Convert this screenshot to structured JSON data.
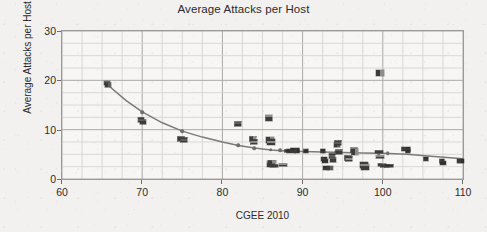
{
  "chart_data": {
    "type": "scatter",
    "title": "Average Attacks per Host",
    "xlabel": "CGEE 2010",
    "ylabel": "Average Attacks per Host",
    "xlim": [
      60,
      110
    ],
    "ylim": [
      0,
      30
    ],
    "xticks": [
      60,
      70,
      80,
      90,
      100,
      110
    ],
    "yticks": [
      0,
      10,
      20,
      30
    ],
    "x_minor_step": 2.5,
    "y_minor_step": 2.5,
    "grid": true,
    "legend": "none",
    "marker_style": "country-flag-icons",
    "points": [
      {
        "x": 65.6,
        "y": 19.5
      },
      {
        "x": 65.7,
        "y": 19.0
      },
      {
        "x": 69.9,
        "y": 12.0
      },
      {
        "x": 70.1,
        "y": 11.6
      },
      {
        "x": 74.9,
        "y": 8.2
      },
      {
        "x": 75.2,
        "y": 8.0
      },
      {
        "x": 81.9,
        "y": 11.1
      },
      {
        "x": 83.8,
        "y": 8.1
      },
      {
        "x": 84.0,
        "y": 7.6
      },
      {
        "x": 85.8,
        "y": 12.3
      },
      {
        "x": 85.9,
        "y": 7.9
      },
      {
        "x": 86.0,
        "y": 7.6
      },
      {
        "x": 86.0,
        "y": 3.0
      },
      {
        "x": 86.2,
        "y": 3.4
      },
      {
        "x": 86.4,
        "y": 2.7
      },
      {
        "x": 87.6,
        "y": 2.8
      },
      {
        "x": 88.3,
        "y": 5.6
      },
      {
        "x": 88.6,
        "y": 5.7
      },
      {
        "x": 89.0,
        "y": 5.9
      },
      {
        "x": 89.3,
        "y": 5.6
      },
      {
        "x": 90.4,
        "y": 5.6
      },
      {
        "x": 92.6,
        "y": 5.7
      },
      {
        "x": 92.7,
        "y": 4.1
      },
      {
        "x": 92.8,
        "y": 3.7
      },
      {
        "x": 92.9,
        "y": 2.3
      },
      {
        "x": 93.4,
        "y": 2.3
      },
      {
        "x": 93.7,
        "y": 4.6
      },
      {
        "x": 93.8,
        "y": 3.9
      },
      {
        "x": 94.3,
        "y": 6.8
      },
      {
        "x": 94.4,
        "y": 7.2
      },
      {
        "x": 94.6,
        "y": 5.5
      },
      {
        "x": 95.6,
        "y": 4.3
      },
      {
        "x": 95.8,
        "y": 4.0
      },
      {
        "x": 96.4,
        "y": 5.8
      },
      {
        "x": 96.5,
        "y": 5.4
      },
      {
        "x": 97.6,
        "y": 2.9
      },
      {
        "x": 97.8,
        "y": 2.4
      },
      {
        "x": 99.6,
        "y": 21.5
      },
      {
        "x": 99.5,
        "y": 5.4
      },
      {
        "x": 99.6,
        "y": 4.5
      },
      {
        "x": 99.9,
        "y": 2.8
      },
      {
        "x": 100.3,
        "y": 2.6
      },
      {
        "x": 100.8,
        "y": 2.7
      },
      {
        "x": 102.9,
        "y": 6.1
      },
      {
        "x": 103.1,
        "y": 5.6
      },
      {
        "x": 105.4,
        "y": 4.0
      },
      {
        "x": 107.4,
        "y": 3.6
      },
      {
        "x": 107.5,
        "y": 3.3
      },
      {
        "x": 109.6,
        "y": 3.7
      },
      {
        "x": 109.8,
        "y": 3.6
      }
    ],
    "trend_line": {
      "name": "fitted power-law trend",
      "color": "#7a7a7a",
      "points": [
        {
          "x": 65.6,
          "y": 19.2
        },
        {
          "x": 68.0,
          "y": 15.9
        },
        {
          "x": 70.0,
          "y": 13.6
        },
        {
          "x": 72.5,
          "y": 11.4
        },
        {
          "x": 75.0,
          "y": 9.7
        },
        {
          "x": 77.5,
          "y": 8.5
        },
        {
          "x": 80.0,
          "y": 7.5
        },
        {
          "x": 82.0,
          "y": 6.8
        },
        {
          "x": 84.0,
          "y": 6.3
        },
        {
          "x": 86.0,
          "y": 5.9
        },
        {
          "x": 88.0,
          "y": 5.7
        },
        {
          "x": 90.0,
          "y": 5.6
        },
        {
          "x": 92.5,
          "y": 5.5
        },
        {
          "x": 95.0,
          "y": 5.4
        },
        {
          "x": 97.5,
          "y": 5.3
        },
        {
          "x": 100.0,
          "y": 5.2
        },
        {
          "x": 103.0,
          "y": 5.0
        },
        {
          "x": 106.0,
          "y": 4.6
        },
        {
          "x": 110.0,
          "y": 4.1
        }
      ],
      "node_markers": [
        {
          "x": 82.0,
          "y": 6.8
        },
        {
          "x": 84.0,
          "y": 6.3
        },
        {
          "x": 86.0,
          "y": 5.9
        },
        {
          "x": 87.2,
          "y": 5.8
        },
        {
          "x": 88.4,
          "y": 5.7
        },
        {
          "x": 92.6,
          "y": 5.5
        },
        {
          "x": 94.2,
          "y": 5.5
        },
        {
          "x": 99.5,
          "y": 5.2
        },
        {
          "x": 100.6,
          "y": 5.2
        },
        {
          "x": 70.0,
          "y": 13.6
        },
        {
          "x": 75.0,
          "y": 9.7
        },
        {
          "x": 65.6,
          "y": 19.2
        }
      ]
    }
  },
  "axes": {
    "x_tick_labels": [
      "60",
      "70",
      "80",
      "90",
      "100",
      "110"
    ],
    "y_tick_labels": [
      "0",
      "10",
      "20",
      "30"
    ]
  }
}
